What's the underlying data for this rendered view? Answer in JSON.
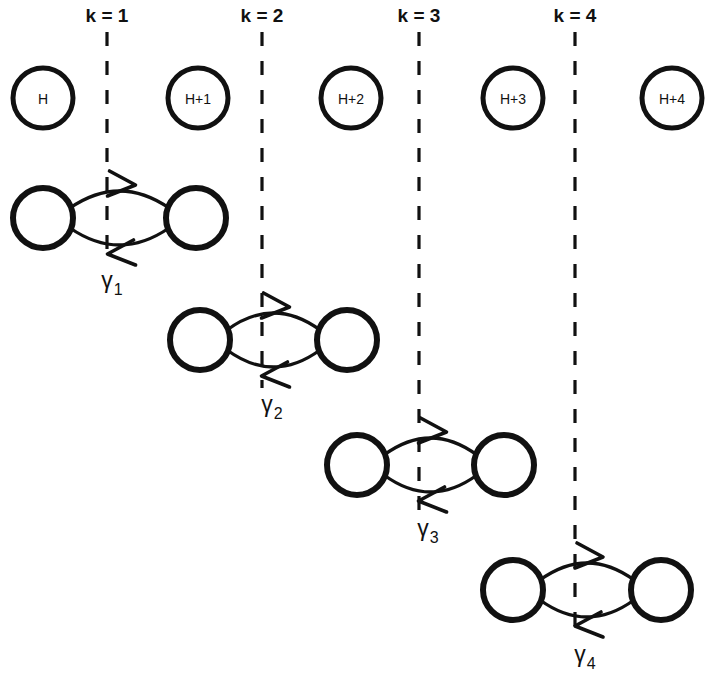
{
  "figure": {
    "background_color": "#ffffff",
    "stroke_color": "#111111",
    "width": 709,
    "height": 690
  },
  "energy_levels": {
    "row_y": 98,
    "radius": 30,
    "nodes": [
      {
        "label": "H",
        "cx": 43,
        "font_size": 14
      },
      {
        "label": "H+1",
        "cx": 198,
        "font_size": 14
      },
      {
        "label": "H+2",
        "cx": 351,
        "font_size": 14
      },
      {
        "label": "H+3",
        "cx": 513,
        "font_size": 14
      },
      {
        "label": "H+4",
        "cx": 672,
        "font_size": 14
      }
    ]
  },
  "cut_lines": [
    {
      "name": "k = 1",
      "label": "k = 1",
      "x": 107,
      "label_y": 22,
      "y_top": 32,
      "y_bottom": 262
    },
    {
      "name": "k = 2",
      "label": "k = 2",
      "x": 262,
      "label_y": 22,
      "y_top": 32,
      "y_bottom": 388
    },
    {
      "name": "k = 3",
      "label": "k = 3",
      "x": 419,
      "label_y": 22,
      "y_top": 32,
      "y_bottom": 512
    },
    {
      "name": "k = 4",
      "label": "k = 4",
      "x": 575,
      "label_y": 22,
      "y_top": 32,
      "y_bottom": 636
    }
  ],
  "coupling_pairs": [
    {
      "gamma": "γ",
      "subscript": "1",
      "left_cx": 43,
      "right_cx": 196,
      "cy": 218,
      "radius": 30,
      "label_x": 112,
      "label_y": 288,
      "top_arrow_direction": "right",
      "bottom_arrow_direction": "left"
    },
    {
      "gamma": "γ",
      "subscript": "2",
      "left_cx": 200,
      "right_cx": 347,
      "cy": 340,
      "radius": 30,
      "label_x": 272,
      "label_y": 412,
      "top_arrow_direction": "right",
      "bottom_arrow_direction": "left"
    },
    {
      "gamma": "γ",
      "subscript": "3",
      "left_cx": 357,
      "right_cx": 504,
      "cy": 465,
      "radius": 30,
      "label_x": 428,
      "label_y": 536,
      "top_arrow_direction": "right",
      "bottom_arrow_direction": "left"
    },
    {
      "gamma": "γ",
      "subscript": "4",
      "left_cx": 513,
      "right_cx": 661,
      "cy": 590,
      "radius": 30,
      "label_x": 585,
      "label_y": 662,
      "top_arrow_direction": "right",
      "bottom_arrow_direction": "left"
    }
  ]
}
